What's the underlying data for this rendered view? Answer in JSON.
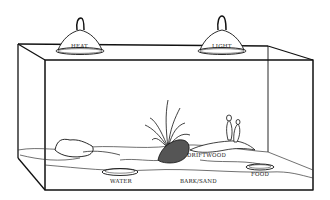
{
  "diagram": {
    "lamps": [
      {
        "label": "HEAT"
      },
      {
        "label": "LIGHT"
      }
    ],
    "labels": {
      "driftwood": "DRIFTWOOD",
      "water": "WATER",
      "substrate": "BARK/SAND",
      "food": "FOOD"
    },
    "colors": {
      "ink": "#111111",
      "paper": "#ffffff",
      "shade": "#555555"
    }
  }
}
